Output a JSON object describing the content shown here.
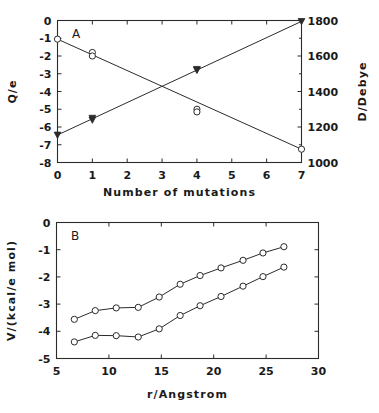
{
  "figure": {
    "background": "#ffffff",
    "ink": "#2b2b2b",
    "width": 379,
    "height": 413
  },
  "chart_data": [
    {
      "type": "line",
      "panel_label": "A",
      "title": "",
      "xlabel": "Number of mutations",
      "ylabel": "Q/e",
      "y2label": "D/Debye",
      "xlim": [
        0,
        7
      ],
      "ylim": [
        -8,
        0
      ],
      "y2lim": [
        1000,
        1800
      ],
      "xticks": [
        0,
        1,
        2,
        3,
        4,
        5,
        6,
        7
      ],
      "xticklabels": [
        "0",
        "1",
        "2",
        "3",
        "4",
        "5",
        "6",
        "7"
      ],
      "yticks": [
        0,
        -1,
        -2,
        -3,
        -4,
        -5,
        -6,
        -7,
        -8
      ],
      "yticklabels": [
        "0",
        "-1",
        "-2",
        "-3",
        "-4",
        "-5",
        "-6",
        "-7",
        "-8"
      ],
      "y2ticks": [
        1000,
        1200,
        1400,
        1600,
        1800
      ],
      "y2ticklabels": [
        "1000",
        "1200",
        "1400",
        "1600",
        "1800"
      ],
      "grid": false,
      "legend": "none",
      "series": [
        {
          "name": "Charge Q/e",
          "axis": "left",
          "marker": "circle",
          "x": [
            0,
            1,
            1,
            4,
            4,
            7
          ],
          "values": [
            -1.05,
            -1.8,
            -2.0,
            -5.0,
            -5.15,
            -7.25
          ]
        },
        {
          "name": "Dipole moment D/Debye",
          "axis": "right",
          "marker": "triangle-down",
          "x": [
            0,
            1,
            1,
            4,
            4,
            7
          ],
          "values": [
            1155,
            1250,
            1240,
            1525,
            1520,
            1795
          ]
        }
      ]
    },
    {
      "type": "line",
      "panel_label": "B",
      "title": "",
      "xlabel": "r/Angstrom",
      "ylabel": "V/(kcal/e mol)",
      "xlim": [
        5,
        30
      ],
      "ylim": [
        -5,
        0
      ],
      "xticks": [
        5,
        10,
        15,
        20,
        25,
        30
      ],
      "xticklabels": [
        "5",
        "10",
        "15",
        "20",
        "25",
        "30"
      ],
      "yticks": [
        0,
        -1,
        -2,
        -3,
        -4,
        -5
      ],
      "yticklabels": [
        "0",
        "-1",
        "-2",
        "-3",
        "-4",
        "-5"
      ],
      "grid": false,
      "legend": "none",
      "series": [
        {
          "name": "upper curve",
          "marker": "circle",
          "x": [
            6.7,
            8.7,
            10.7,
            12.8,
            14.8,
            16.8,
            18.7,
            20.7,
            22.8,
            24.7,
            26.7
          ],
          "values": [
            -3.56,
            -3.24,
            -3.14,
            -3.12,
            -2.74,
            -2.27,
            -1.95,
            -1.67,
            -1.39,
            -1.12,
            -0.89
          ]
        },
        {
          "name": "lower curve",
          "marker": "circle",
          "x": [
            6.7,
            8.7,
            10.7,
            12.8,
            14.8,
            16.8,
            18.7,
            20.7,
            22.8,
            24.7,
            26.7
          ],
          "values": [
            -4.39,
            -4.15,
            -4.16,
            -4.21,
            -3.91,
            -3.42,
            -3.06,
            -2.72,
            -2.34,
            -1.99,
            -1.64
          ]
        }
      ]
    }
  ]
}
